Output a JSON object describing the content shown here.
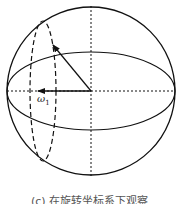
{
  "figure": {
    "type": "diagram",
    "colors": {
      "stroke": "#111111",
      "background": "#ffffff",
      "caption": "#555555"
    },
    "sphere": {
      "cx": 91,
      "cy": 91,
      "r": 84
    },
    "equator": {
      "cx": 91,
      "cy": 91,
      "rx": 84,
      "ry": 39
    },
    "precession_circle": {
      "cx": 43,
      "cy": 91,
      "rx": 13,
      "ry": 70,
      "style": "dashed"
    },
    "axes": {
      "vertical": "dashed",
      "horizontal": "dashed"
    },
    "vectors": [
      {
        "name": "magnetization-vector",
        "from": [
          91,
          91
        ],
        "to": [
          53,
          45
        ]
      },
      {
        "name": "omega-1-vector",
        "from": [
          91,
          91
        ],
        "to": [
          38,
          91
        ],
        "label": "ω",
        "label_sub": "1"
      }
    ]
  },
  "labels": {
    "omega_main": "ω",
    "omega_sub": "1"
  },
  "caption": "(c) 在旋转坐标系下观察"
}
